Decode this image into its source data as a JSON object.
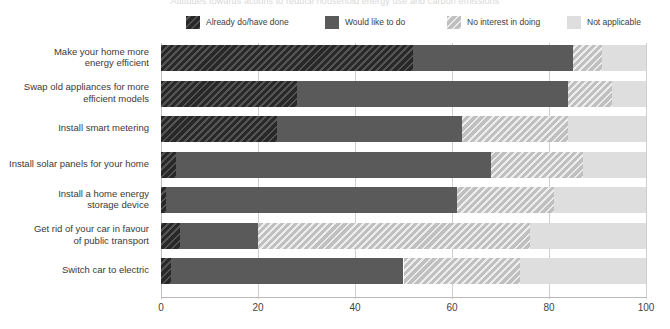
{
  "chart_data": {
    "type": "bar",
    "subtype": "stacked-horizontal-100",
    "title": "Attitudes towards actions to reduce household energy use and carbon emissions",
    "xlabel": "",
    "ylabel": "",
    "xlim": [
      0,
      100
    ],
    "xticks": [
      "0",
      "20",
      "40",
      "60",
      "80",
      "100"
    ],
    "grid": true,
    "legend_position": "top",
    "categories": [
      "Make your home more energy efficient",
      "Swap old appliances for more efficient models",
      "Install smart metering",
      "Install solar panels for your home",
      "Install a home energy storage device",
      "Get rid of your car in favour of public transport",
      "Switch car to electric"
    ],
    "category_lines": [
      [
        "Make your home more",
        "energy efficient"
      ],
      [
        "Swap old appliances for more",
        "efficient models"
      ],
      [
        "Install smart metering"
      ],
      [
        "Install solar panels for your home"
      ],
      [
        "Install a home energy",
        "storage device"
      ],
      [
        "Get rid of your car in favour",
        "of public transport"
      ],
      [
        "Switch car to electric"
      ]
    ],
    "series": [
      {
        "name": "Already do/have done",
        "color": "#333333",
        "pattern": "diagonal-hatch",
        "values": [
          52,
          28,
          24,
          3,
          1,
          4,
          2
        ]
      },
      {
        "name": "Would like to do",
        "color": "#5a5a5a",
        "pattern": "solid",
        "values": [
          33,
          56,
          38,
          65,
          60,
          16,
          48
        ]
      },
      {
        "name": "No interest in doing",
        "color": "#d6d6d6",
        "pattern": "diagonal-hatch",
        "values": [
          6,
          9,
          22,
          19,
          20,
          56,
          24
        ]
      },
      {
        "name": "Not applicable",
        "color": "#dedede",
        "pattern": "solid",
        "values": [
          9,
          7,
          16,
          13,
          19,
          24,
          26
        ]
      }
    ]
  },
  "legend": {
    "items": [
      {
        "label": "Already do/have done",
        "color": "#333333",
        "x": 0
      },
      {
        "label": "Would like to do",
        "color": "#5a5a5a",
        "x": 139
      },
      {
        "label": "No interest in doing",
        "color": "#d6d6d6",
        "x": 261
      },
      {
        "label": "Not applicable",
        "color": "#dedede",
        "x": 381
      }
    ]
  }
}
